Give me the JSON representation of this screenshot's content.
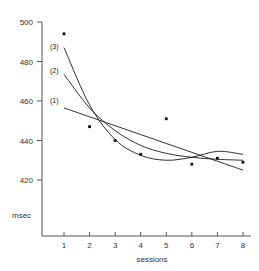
{
  "chart_data": {
    "type": "scatter",
    "title": "",
    "xlabel": "sessions",
    "ylabel": "msec",
    "xlim": [
      0.55,
      8.45
    ],
    "ylim": [
      408,
      500
    ],
    "grid": false,
    "legend": "inline-curve-labels",
    "x": [
      1,
      2,
      3,
      4,
      5,
      6,
      7,
      8
    ],
    "xticks": [
      "1",
      "2",
      "3",
      "4",
      "5",
      "6",
      "7",
      "8"
    ],
    "yticks": [
      "420",
      "440",
      "460",
      "480",
      "500"
    ],
    "ytick_values": [
      420,
      440,
      460,
      480,
      500
    ],
    "points": {
      "name": "observed mean reaction time",
      "values": [
        494,
        447,
        440,
        433,
        451,
        428,
        431,
        429
      ]
    },
    "series": [
      {
        "name": "(1)",
        "label": "(1)",
        "description": "linear fit",
        "values": [
          456.5,
          452.0,
          447.5,
          443.0,
          438.5,
          434.0,
          429.5,
          425.0
        ]
      },
      {
        "name": "(2)",
        "label": "(2)",
        "description": "exponential / power fit",
        "values": [
          473.5,
          456.5,
          445.0,
          437.5,
          433.5,
          431.5,
          430.5,
          430.0
        ]
      },
      {
        "name": "(3)",
        "label": "(3)",
        "description": "polynomial fit",
        "values": [
          487.0,
          458.0,
          440.5,
          432.5,
          430.0,
          431.5,
          434.5,
          433.0
        ]
      }
    ]
  },
  "labels": {
    "curve1": "(1)",
    "curve2": "(2)",
    "curve3": "(3)",
    "y_axis_unit": "msec",
    "x_axis_title": "sessions"
  }
}
